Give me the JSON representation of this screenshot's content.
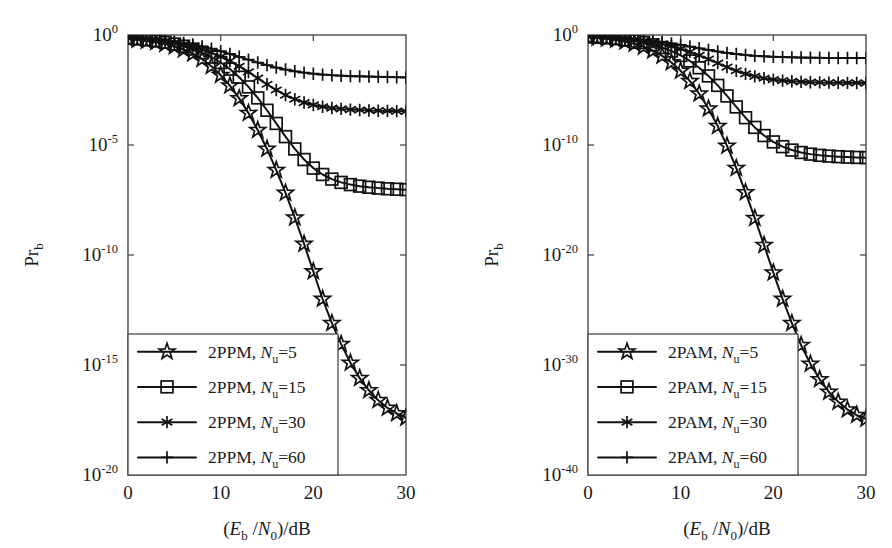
{
  "figure": {
    "background": "#ffffff",
    "ink_color": "#111111",
    "axis_color": "#4a4a4a"
  },
  "chart_data": [
    {
      "type": "line",
      "panel": "left",
      "title": "",
      "xlabel": "(E_b /N_0)/dB",
      "xlabel_parts": {
        "open": "(",
        "e": "E",
        "e_sub": "b",
        "slash1": " /",
        "n": "N",
        "n_sub": "0",
        "close": ")/dB"
      },
      "ylabel": "Pr_b",
      "ylabel_parts": {
        "main": "Pr",
        "sub": "b"
      },
      "xlim": [
        0,
        30
      ],
      "ylim_exp": [
        -20,
        0
      ],
      "xticks": [
        0,
        10,
        20,
        30
      ],
      "xticklabels": [
        "0",
        "10",
        "20",
        "30"
      ],
      "yticks_exp": [
        0,
        -5,
        -10,
        -15,
        -20
      ],
      "yticklabels": [
        "10 0",
        "10 -5",
        "10 -10",
        "10 -15",
        "10 -20"
      ],
      "ytick_mantissa": "10",
      "ytick_exponents": [
        "0",
        "-5",
        "-10",
        "-15",
        "-20"
      ],
      "grid": false,
      "legend_position": "lower left",
      "x": [
        0,
        1,
        2,
        3,
        4,
        5,
        6,
        7,
        8,
        9,
        10,
        11,
        12,
        13,
        14,
        15,
        16,
        17,
        18,
        19,
        20,
        21,
        22,
        23,
        24,
        25,
        26,
        27,
        28,
        29,
        30
      ],
      "series": [
        {
          "name": "2PPM, Nu=5",
          "label_prefix": "2PPM, ",
          "label_symbol": "N",
          "label_sub": "u",
          "label_value": "=5",
          "marker": "star",
          "values_exp": [
            -0.18,
            -0.22,
            -0.27,
            -0.33,
            -0.41,
            -0.52,
            -0.66,
            -0.85,
            -1.1,
            -1.42,
            -1.82,
            -2.3,
            -2.88,
            -3.55,
            -4.32,
            -5.18,
            -6.14,
            -7.18,
            -8.3,
            -9.5,
            -10.75,
            -12.0,
            -13.1,
            -14.05,
            -14.9,
            -15.6,
            -16.15,
            -16.6,
            -16.95,
            -17.2,
            -17.4
          ]
        },
        {
          "name": "2PPM, Nu=15",
          "label_prefix": "2PPM, ",
          "label_symbol": "N",
          "label_sub": "u",
          "label_value": "=15",
          "marker": "square",
          "values_exp": [
            -0.15,
            -0.18,
            -0.22,
            -0.27,
            -0.33,
            -0.41,
            -0.51,
            -0.64,
            -0.8,
            -1.0,
            -1.25,
            -1.55,
            -1.92,
            -2.36,
            -2.86,
            -3.42,
            -4.02,
            -4.62,
            -5.18,
            -5.66,
            -6.05,
            -6.34,
            -6.55,
            -6.7,
            -6.8,
            -6.87,
            -6.92,
            -6.96,
            -6.99,
            -7.01,
            -7.03
          ]
        },
        {
          "name": "2PPM, Nu=30",
          "label_prefix": "2PPM, ",
          "label_symbol": "N",
          "label_sub": "u",
          "label_value": "=30",
          "marker": "asterisk",
          "values_exp": [
            -0.14,
            -0.17,
            -0.2,
            -0.24,
            -0.29,
            -0.35,
            -0.43,
            -0.53,
            -0.65,
            -0.8,
            -0.98,
            -1.18,
            -1.42,
            -1.68,
            -1.96,
            -2.24,
            -2.5,
            -2.73,
            -2.92,
            -3.07,
            -3.18,
            -3.26,
            -3.32,
            -3.36,
            -3.39,
            -3.41,
            -3.43,
            -3.44,
            -3.45,
            -3.46,
            -3.47
          ]
        },
        {
          "name": "2PPM, Nu=60",
          "label_prefix": "2PPM, ",
          "label_symbol": "N",
          "label_sub": "u",
          "label_value": "=60",
          "marker": "plus",
          "values_exp": [
            -0.13,
            -0.15,
            -0.18,
            -0.21,
            -0.25,
            -0.3,
            -0.36,
            -0.43,
            -0.52,
            -0.62,
            -0.73,
            -0.86,
            -0.99,
            -1.12,
            -1.25,
            -1.37,
            -1.48,
            -1.57,
            -1.65,
            -1.71,
            -1.76,
            -1.8,
            -1.83,
            -1.85,
            -1.87,
            -1.88,
            -1.89,
            -1.9,
            -1.91,
            -1.92,
            -1.93
          ]
        }
      ]
    },
    {
      "type": "line",
      "panel": "right",
      "title": "",
      "xlabel": "(E_b /N_0)/dB",
      "xlabel_parts": {
        "open": "(",
        "e": "E",
        "e_sub": "b",
        "slash1": " /",
        "n": "N",
        "n_sub": "0",
        "close": ")/dB"
      },
      "ylabel": "Pr_b",
      "ylabel_parts": {
        "main": "Pr",
        "sub": "b"
      },
      "xlim": [
        0,
        30
      ],
      "ylim_exp": [
        -40,
        0
      ],
      "xticks": [
        0,
        10,
        20,
        30
      ],
      "xticklabels": [
        "0",
        "10",
        "20",
        "30"
      ],
      "yticks_exp": [
        0,
        -10,
        -20,
        -30,
        -40
      ],
      "yticklabels": [
        "10 0",
        "10 -10",
        "10 -20",
        "10 -30",
        "10 -40"
      ],
      "ytick_mantissa": "10",
      "ytick_exponents": [
        "0",
        "-10",
        "-20",
        "-30",
        "-40"
      ],
      "grid": false,
      "legend_position": "lower left",
      "x": [
        0,
        1,
        2,
        3,
        4,
        5,
        6,
        7,
        8,
        9,
        10,
        11,
        12,
        13,
        14,
        15,
        16,
        17,
        18,
        19,
        20,
        21,
        22,
        23,
        24,
        25,
        26,
        27,
        28,
        29,
        30
      ],
      "series": [
        {
          "name": "2PAM, Nu=5",
          "label_prefix": "2PAM, ",
          "label_symbol": "N",
          "label_sub": "u",
          "label_value": "=5",
          "marker": "star",
          "values_exp": [
            -0.2,
            -0.26,
            -0.34,
            -0.45,
            -0.6,
            -0.8,
            -1.07,
            -1.43,
            -1.9,
            -2.5,
            -3.26,
            -4.2,
            -5.34,
            -6.7,
            -8.28,
            -10.08,
            -12.1,
            -14.3,
            -16.65,
            -19.1,
            -21.6,
            -24.0,
            -26.2,
            -28.2,
            -29.9,
            -31.3,
            -32.45,
            -33.35,
            -34.05,
            -34.55,
            -34.9
          ]
        },
        {
          "name": "2PAM, Nu=15",
          "label_prefix": "2PAM, ",
          "label_symbol": "N",
          "label_sub": "u",
          "label_value": "=15",
          "marker": "square",
          "values_exp": [
            -0.17,
            -0.21,
            -0.26,
            -0.33,
            -0.42,
            -0.54,
            -0.69,
            -0.89,
            -1.14,
            -1.46,
            -1.86,
            -2.36,
            -2.98,
            -3.72,
            -4.58,
            -5.54,
            -6.54,
            -7.52,
            -8.4,
            -9.14,
            -9.72,
            -10.15,
            -10.46,
            -10.68,
            -10.83,
            -10.94,
            -11.01,
            -11.06,
            -11.1,
            -11.13,
            -11.15
          ]
        },
        {
          "name": "2PAM, Nu=30",
          "label_prefix": "2PAM, ",
          "label_symbol": "N",
          "label_sub": "u",
          "label_value": "=30",
          "marker": "asterisk",
          "values_exp": [
            -0.16,
            -0.19,
            -0.23,
            -0.28,
            -0.34,
            -0.42,
            -0.52,
            -0.65,
            -0.81,
            -1.01,
            -1.25,
            -1.53,
            -1.85,
            -2.2,
            -2.56,
            -2.92,
            -3.25,
            -3.53,
            -3.76,
            -3.93,
            -4.06,
            -4.15,
            -4.21,
            -4.26,
            -4.29,
            -4.31,
            -4.33,
            -4.34,
            -4.35,
            -4.36,
            -4.37
          ]
        },
        {
          "name": "2PAM, Nu=60",
          "label_prefix": "2PAM, ",
          "label_symbol": "N",
          "label_sub": "u",
          "label_value": "=60",
          "marker": "plus",
          "values_exp": [
            -0.14,
            -0.17,
            -0.2,
            -0.24,
            -0.29,
            -0.35,
            -0.43,
            -0.52,
            -0.63,
            -0.76,
            -0.9,
            -1.05,
            -1.21,
            -1.36,
            -1.5,
            -1.63,
            -1.73,
            -1.82,
            -1.89,
            -1.94,
            -1.98,
            -2.01,
            -2.03,
            -2.05,
            -2.06,
            -2.07,
            -2.08,
            -2.085,
            -2.09,
            -2.095,
            -2.1
          ]
        }
      ]
    }
  ]
}
